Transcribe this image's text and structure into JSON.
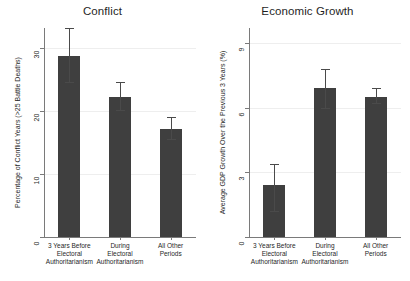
{
  "figure": {
    "categories": [
      "3 Years Before\nElectoral\nAuthoritarianism",
      "During\nElectoral\nAuthoritarianism",
      "All Other\nPeriods"
    ],
    "bar_color": "#3f3f3f",
    "grid_color": "#eeeeee",
    "axis_color": "#7a7a7a"
  },
  "chart_data": [
    {
      "type": "bar",
      "title": "Conflict",
      "xlabel": "",
      "ylabel": "Percentage of Conflict Years (>25 Battle Deaths)",
      "categories": [
        "3 Years Before\nElectoral\nAuthoritarianism",
        "During\nElectoral\nAuthoritarianism",
        "All Other\nPeriods"
      ],
      "values": [
        28.8,
        22.2,
        17.2
      ],
      "error_low": [
        24.7,
        20.2,
        15.5
      ],
      "error_high": [
        33.2,
        24.6,
        19.0
      ],
      "yticks": [
        0,
        10,
        20,
        30
      ],
      "ylim": [
        0,
        33.2
      ],
      "grid": true,
      "legend": "none"
    },
    {
      "type": "bar",
      "title": "Economic Growth",
      "xlabel": "",
      "ylabel": "Average GDP Growth Over the Previous 3 Years (%)",
      "categories": [
        "3 Years Before\nElectoral\nAuthoritarianism",
        "During\nElectoral\nAuthoritarianism",
        "All Other\nPeriods"
      ],
      "values": [
        2.4,
        6.9,
        6.5
      ],
      "error_low": [
        1.2,
        6.0,
        6.2
      ],
      "error_high": [
        3.4,
        7.8,
        6.9
      ],
      "yticks": [
        0,
        3,
        6,
        9
      ],
      "ylim": [
        0,
        9.7
      ],
      "grid": true,
      "legend": "none"
    }
  ]
}
